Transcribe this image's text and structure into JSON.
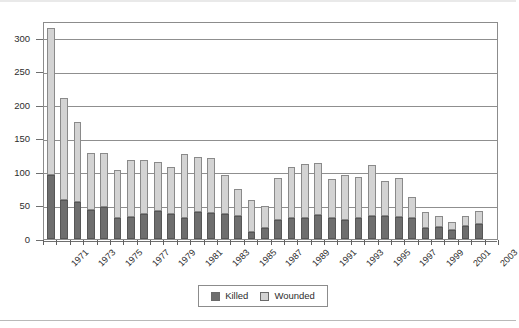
{
  "chart_data": {
    "type": "bar",
    "subtype": "stacked-column",
    "title": "",
    "subtitle": "",
    "xlabel": "",
    "ylabel": "",
    "xlim": [
      "1971",
      "2004"
    ],
    "ylim": [
      0,
      325
    ],
    "yticks": [
      0,
      50,
      100,
      150,
      200,
      250,
      300
    ],
    "ytick_labels": [
      "0",
      "50",
      "100",
      "150",
      "200",
      "250",
      "300"
    ],
    "grid": "horizontal",
    "legend_position": "bottom-center",
    "categories": [
      "1971",
      "1972",
      "1973",
      "1974",
      "1975",
      "1976",
      "1977",
      "1978",
      "1979",
      "1980",
      "1981",
      "1982",
      "1983",
      "1984",
      "1985",
      "1986",
      "1987",
      "1988",
      "1989",
      "1990",
      "1991",
      "1992",
      "1993",
      "1994",
      "1995",
      "1996",
      "1997",
      "1998",
      "1999",
      "2000",
      "2001",
      "2002",
      "2003",
      "2004"
    ],
    "xtick_labels_shown": [
      "1971",
      "1973",
      "1975",
      "1977",
      "1979",
      "1981",
      "1983",
      "1985",
      "1987",
      "1989",
      "1991",
      "1993",
      "1995",
      "1997",
      "1999",
      "2001",
      "2003"
    ],
    "series": [
      {
        "name": "Killed",
        "color": "#6e6e6e",
        "values": [
          96,
          58,
          55,
          44,
          47,
          31,
          33,
          38,
          42,
          38,
          32,
          40,
          39,
          37,
          35,
          11,
          16,
          29,
          31,
          31,
          36,
          31,
          29,
          32,
          35,
          34,
          33,
          31,
          16,
          18,
          14,
          19,
          23,
          0
        ]
      },
      {
        "name": "Wounded",
        "color": "#d3d3d3",
        "values": [
          218,
          152,
          120,
          84,
          81,
          72,
          85,
          80,
          73,
          70,
          95,
          83,
          82,
          58,
          39,
          47,
          33,
          62,
          77,
          81,
          78,
          58,
          67,
          60,
          75,
          53,
          58,
          31,
          24,
          17,
          12,
          15,
          19,
          0
        ]
      }
    ],
    "totals": [
      314,
      210,
      175,
      128,
      128,
      103,
      118,
      118,
      115,
      108,
      127,
      123,
      121,
      95,
      74,
      58,
      49,
      91,
      108,
      112,
      114,
      89,
      96,
      92,
      110,
      87,
      91,
      62,
      40,
      35,
      26,
      34,
      42,
      0
    ]
  },
  "legend": {
    "entries": [
      {
        "label": "Killed",
        "color": "#6e6e6e"
      },
      {
        "label": "Wounded",
        "color": "#d3d3d3"
      }
    ]
  },
  "colors": {
    "killed": "#6e6e6e",
    "wounded": "#d3d3d3",
    "gridline": "#8f8f8f",
    "frame": "#8c8c8c",
    "text": "#2d2d2d",
    "background": "#ffffff"
  }
}
